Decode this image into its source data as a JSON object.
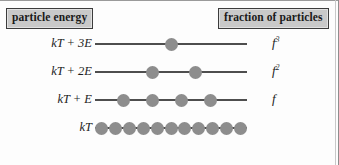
{
  "figure": {
    "header_left": "particle energy",
    "header_right": "fraction of particles",
    "colors": {
      "dot": "#8d8d8d",
      "line": "#4e4e4e",
      "box_fill": "#c9c9c9",
      "box_border": "#3c3c3c",
      "text": "#1c1c1c",
      "background": "#fdfdfd"
    },
    "levels": [
      {
        "energy_label": "kT + 3E",
        "fraction_base": "f",
        "fraction_exponent": "3",
        "particle_count": 1,
        "dot_positions_pct": [
          50.0
        ],
        "line_x": 95,
        "line_width": 152
      },
      {
        "energy_label": "kT + 2E",
        "fraction_base": "f",
        "fraction_exponent": "2",
        "particle_count": 2,
        "dot_positions_pct": [
          38.0,
          66.0
        ],
        "line_x": 95,
        "line_width": 152
      },
      {
        "energy_label": "kT + E",
        "fraction_base": "f",
        "fraction_exponent": "",
        "particle_count": 4,
        "dot_positions_pct": [
          19.0,
          38.0,
          57.0,
          76.0
        ],
        "line_x": 95,
        "line_width": 152
      },
      {
        "energy_label": "kT",
        "fraction_base": "",
        "fraction_exponent": "",
        "particle_count": 11,
        "dot_positions_pct": [
          4.0,
          13.3,
          22.6,
          31.9,
          41.2,
          50.0,
          58.8,
          68.1,
          77.4,
          86.7,
          96.0
        ],
        "line_x": 95,
        "line_width": 152
      }
    ],
    "row_tops": [
      36,
      64,
      92,
      120
    ]
  }
}
